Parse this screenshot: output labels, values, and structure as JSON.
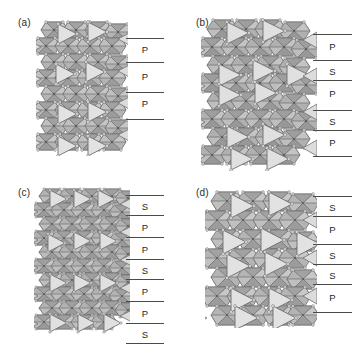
{
  "figure": {
    "type": "crystal-structure-polyhedral-diagram",
    "panel_count": 4,
    "colors": {
      "light_polyhedron": "#dcdcdc",
      "mid_polyhedron": "#b0b0b0",
      "dark_polyhedron": "#9a9a9a",
      "edge": "#6e6e6e",
      "vertex": "#f2f2f2",
      "legend_line": "#4a4a4a",
      "background": "#ffffff"
    }
  },
  "panels": [
    {
      "id": "a",
      "label": "(a)",
      "layer_labels": [
        "P",
        "P",
        "P"
      ],
      "line_count": 4,
      "stacking_sequence": "P P P"
    },
    {
      "id": "b",
      "label": "(b)",
      "layer_labels": [
        "P",
        "S",
        "P",
        "S",
        "P"
      ],
      "line_count": 6,
      "stacking_sequence": "P S P S P"
    },
    {
      "id": "c",
      "label": "(c)",
      "layer_labels": [
        "S",
        "P",
        "P",
        "S",
        "P",
        "P",
        "S"
      ],
      "line_count": 8,
      "stacking_sequence": "S P P S P P S"
    },
    {
      "id": "d",
      "label": "(d)",
      "layer_labels": [
        "S",
        "P",
        "S",
        "S",
        "P"
      ],
      "line_count": 6,
      "stacking_sequence": "S P S S P"
    }
  ]
}
